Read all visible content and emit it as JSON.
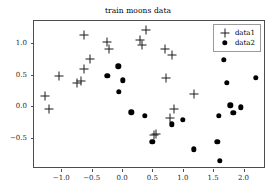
{
  "chart_data": {
    "type": "scatter",
    "title": "train moons data",
    "xlabel": "",
    "ylabel": "",
    "xlim": [
      -1.45,
      2.37
    ],
    "ylim": [
      -0.98,
      1.34
    ],
    "xticks": [
      -1.0,
      -0.5,
      0.0,
      0.5,
      1.0,
      1.5,
      2.0
    ],
    "xticklabels": [
      "-1.0",
      "-0.5",
      "0.0",
      "0.5",
      "1.0",
      "1.5",
      "2.0"
    ],
    "yticks": [
      1.0,
      0.5,
      0.0,
      -0.5
    ],
    "yticklabels": [
      "1.0",
      "0.5",
      "0.0",
      "-0.5"
    ],
    "grid": false,
    "legend_position": "upper right",
    "series": [
      {
        "name": "data1",
        "marker": "plus",
        "color": "#1a1a1a",
        "points": [
          [
            -1.27,
            0.17
          ],
          [
            -1.21,
            -0.04
          ],
          [
            -1.04,
            0.48
          ],
          [
            -0.74,
            0.37
          ],
          [
            -0.67,
            0.4
          ],
          [
            -0.63,
            1.12
          ],
          [
            -0.62,
            0.58
          ],
          [
            -0.53,
            0.75
          ],
          [
            -0.25,
            1.01
          ],
          [
            -0.21,
            0.9
          ],
          [
            0.3,
            1.04
          ],
          [
            0.32,
            0.97
          ],
          [
            0.39,
            1.2
          ],
          [
            0.7,
            0.9
          ],
          [
            0.73,
            0.45
          ],
          [
            0.83,
            0.81
          ],
          [
            0.79,
            -0.18
          ],
          [
            0.86,
            -0.04
          ],
          [
            1.18,
            0.2
          ],
          [
            0.52,
            -0.44
          ],
          [
            0.56,
            -0.43
          ]
        ]
      },
      {
        "name": "data2",
        "marker": "dot",
        "color": "#000000",
        "points": [
          [
            -0.24,
            0.48
          ],
          [
            -0.06,
            0.63
          ],
          [
            0.01,
            0.41
          ],
          [
            -0.05,
            0.23
          ],
          [
            0.15,
            -0.09
          ],
          [
            0.37,
            -0.15
          ],
          [
            0.5,
            -0.55
          ],
          [
            0.82,
            -0.28
          ],
          [
            1.0,
            -0.21
          ],
          [
            1.18,
            -0.67
          ],
          [
            1.57,
            -0.55
          ],
          [
            1.61,
            -0.85
          ],
          [
            1.59,
            -0.15
          ],
          [
            1.68,
            0.73
          ],
          [
            1.72,
            0.37
          ],
          [
            1.78,
            0.02
          ],
          [
            1.83,
            -0.1
          ],
          [
            1.96,
            -0.01
          ],
          [
            2.2,
            0.45
          ]
        ]
      }
    ]
  },
  "legend": {
    "entries": [
      {
        "label": "data1",
        "marker": "plus"
      },
      {
        "label": "data2",
        "marker": "dot"
      }
    ]
  }
}
